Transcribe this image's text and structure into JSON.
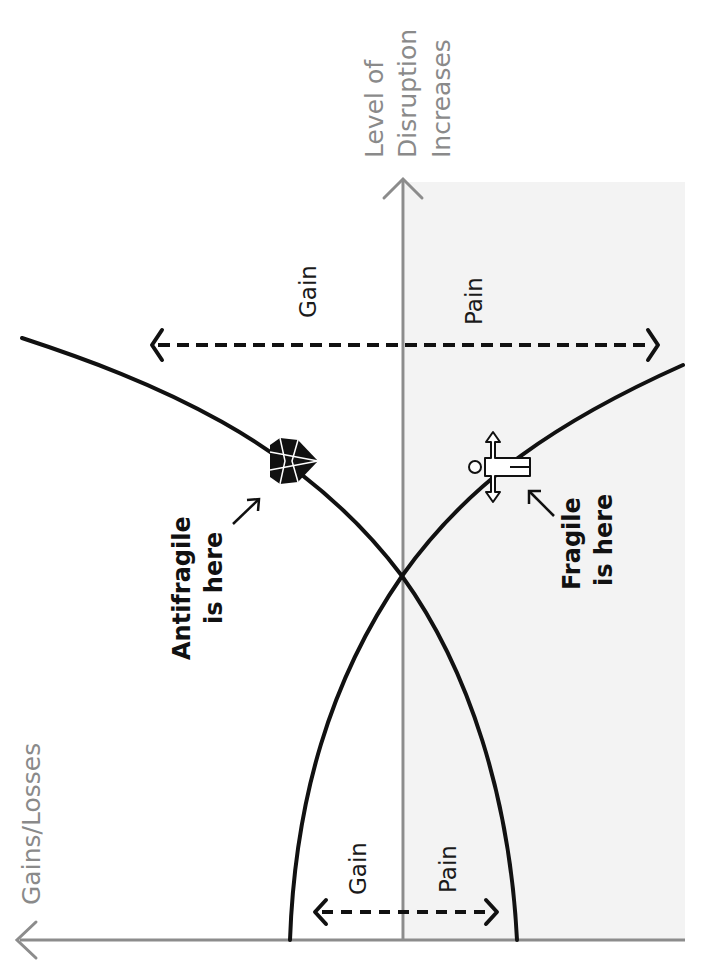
{
  "diagram": {
    "orientation": "rotated -90deg",
    "axes": {
      "x_axis_label": "Gains/Losses",
      "y_axis_label_lines": [
        "Level of",
        "Disruption",
        "Increases"
      ]
    },
    "regions": {
      "top_gain": "Gain",
      "top_pain": "Pain",
      "bottom_gain": "Gain",
      "bottom_pain": "Pain"
    },
    "callouts": {
      "antifragile_lines": [
        "Antifragile",
        "is here"
      ],
      "fragile_lines": [
        "Fragile",
        "is here"
      ]
    },
    "icons": {
      "antifragile": "diamond-icon",
      "fragile": "broken-glass-icon"
    },
    "colors": {
      "curve": "#111111",
      "axis": "#8c8c8c",
      "shaded_region": "#f3f3f3",
      "axis_label": "#8a8a8a"
    }
  }
}
